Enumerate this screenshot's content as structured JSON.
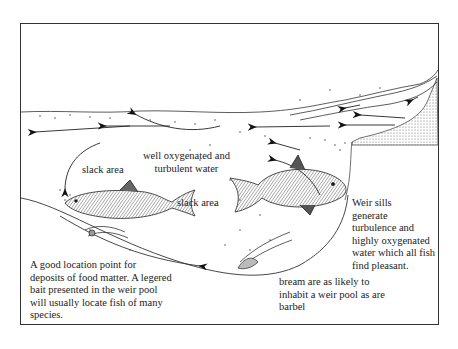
{
  "diagram": {
    "title": "",
    "labels": {
      "slack_area_left": "slack area",
      "slack_area_right": "slack area",
      "oxygenated_line1": "well oxygenated and",
      "oxygenated_line2": "turbulent water",
      "weir_sills": [
        "Weir sills",
        "generate",
        "turbulence and",
        "highly oxygenated",
        "water which all fish",
        "find pleasant."
      ],
      "location_point": [
        "A good location point for",
        "deposits of food matter. A legered",
        "bait presented in the weir pool",
        "will usually locate fish of many",
        "species."
      ],
      "bream": [
        "bream are as likely to",
        "inhabit a weir pool as are",
        "barbel"
      ]
    },
    "elements": {
      "fish": [
        "barbel",
        "bream"
      ],
      "structure": "weir sill",
      "bait": "legered bait"
    },
    "colors": {
      "ink": "#1a1a1a",
      "paper": "#ffffff",
      "stipple": "#777777"
    }
  }
}
